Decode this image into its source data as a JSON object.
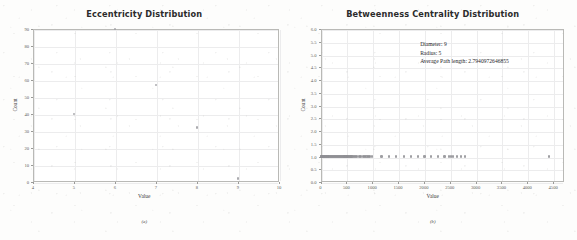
{
  "figure": {
    "panel_a_caption": "(a)",
    "panel_b_caption": "(b)"
  },
  "chart_data": [
    {
      "type": "scatter",
      "panel": "a",
      "title": "Eccentricity Distribution",
      "xlabel": "Value",
      "ylabel": "Count",
      "xlim": [
        4,
        10
      ],
      "ylim": [
        0,
        90
      ],
      "grid": true,
      "legend": "none",
      "xticks": [
        4,
        5,
        6,
        7,
        8,
        9,
        10
      ],
      "xtick_labels": [
        "4",
        "5",
        "6",
        "7",
        "8",
        "9",
        "10"
      ],
      "yticks": [
        0,
        10,
        20,
        30,
        40,
        50,
        60,
        70,
        80,
        90
      ],
      "ytick_labels": [
        "0",
        "10",
        "20",
        "30",
        "40",
        "50",
        "60",
        "70",
        "80",
        "90"
      ],
      "x": [
        5,
        6,
        7,
        8,
        9
      ],
      "y": [
        40,
        90,
        57,
        32,
        2
      ]
    },
    {
      "type": "scatter",
      "panel": "b",
      "title": "Betweenness Centrality Distribution",
      "xlabel": "Value",
      "ylabel": "Count",
      "xlim": [
        0,
        4700
      ],
      "ylim": [
        0,
        6.0
      ],
      "grid": true,
      "legend": "none",
      "xticks": [
        0,
        500,
        1000,
        1500,
        2000,
        2500,
        3000,
        3500,
        4000,
        4500
      ],
      "xtick_labels": [
        "0",
        "500",
        "1000",
        "1500",
        "2000",
        "2500",
        "3000",
        "3500",
        "4000",
        "4500"
      ],
      "yticks": [
        0.0,
        0.5,
        1.0,
        1.5,
        2.0,
        2.5,
        3.0,
        3.5,
        4.0,
        4.5,
        5.0,
        5.5,
        6.0
      ],
      "ytick_labels": [
        "0.0",
        "0.5",
        "1.0",
        "1.5",
        "2.0",
        "2.5",
        "3.0",
        "3.5",
        "4.0",
        "4.5",
        "5.0",
        "5.5",
        "6.0"
      ],
      "x": [
        5,
        14,
        22,
        31,
        40,
        52,
        63,
        75,
        86,
        98,
        110,
        122,
        135,
        148,
        160,
        172,
        185,
        198,
        210,
        224,
        236,
        249,
        262,
        275,
        288,
        300,
        313,
        326,
        340,
        352,
        365,
        378,
        392,
        404,
        418,
        430,
        444,
        456,
        470,
        482,
        496,
        510,
        524,
        538,
        552,
        566,
        580,
        600,
        620,
        645,
        668,
        690,
        712,
        740,
        762,
        790,
        815,
        840,
        868,
        890,
        915,
        940,
        965,
        990,
        1180,
        1320,
        1460,
        1610,
        1750,
        1880,
        2010,
        2140,
        2270,
        2400,
        2480,
        2520,
        2560,
        2640,
        2720,
        2790,
        4420
      ],
      "y": [
        1.0,
        1.0,
        1.0,
        1.0,
        1.0,
        1.0,
        1.0,
        1.0,
        1.0,
        1.0,
        1.0,
        1.0,
        1.0,
        1.0,
        1.0,
        1.0,
        1.0,
        1.0,
        1.0,
        1.0,
        1.0,
        1.0,
        1.0,
        1.0,
        1.0,
        1.0,
        1.0,
        1.0,
        1.0,
        1.0,
        1.0,
        1.0,
        1.0,
        1.0,
        1.0,
        1.0,
        1.0,
        1.0,
        1.0,
        1.0,
        1.0,
        1.0,
        1.0,
        1.0,
        1.0,
        1.0,
        1.0,
        1.0,
        1.0,
        1.0,
        1.0,
        1.0,
        1.0,
        1.0,
        1.0,
        1.0,
        1.0,
        1.0,
        1.0,
        1.0,
        1.0,
        1.0,
        1.0,
        1.0,
        1.0,
        1.0,
        1.0,
        1.0,
        1.0,
        1.0,
        1.0,
        1.0,
        1.0,
        1.0,
        1.0,
        1.0,
        1.0,
        1.0,
        1.0,
        1.0,
        1.0
      ],
      "annotations": [
        "Diameter: 9",
        "Radius: 5",
        "Average Path length: 2.7940972646855"
      ]
    }
  ]
}
